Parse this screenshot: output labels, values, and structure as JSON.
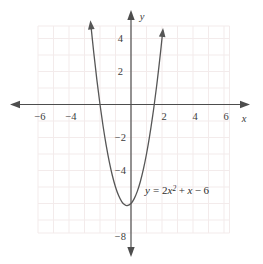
{
  "chart_data": {
    "type": "line",
    "title": "",
    "subtitle": "",
    "xlabel": "x",
    "ylabel": "y",
    "xlim": [
      -7,
      7
    ],
    "ylim": [
      -9,
      5
    ],
    "grid": true,
    "grid_color": "#f2eaea",
    "axis_color": "#4a4a4a",
    "curve_color": "#4a4a4a",
    "legend": "none",
    "annotation": "y = 2x² + x − 6",
    "equation": {
      "lhs": "y",
      "equals": "=",
      "coef": "2",
      "var1": "x",
      "exponent": "2",
      "plus": "+",
      "var2": "x",
      "minus": "−",
      "constant": "6"
    },
    "x_ticks": [
      {
        "value": -6,
        "label": "−6"
      },
      {
        "value": -4,
        "label": "−4"
      },
      {
        "value": -2,
        "label": ""
      },
      {
        "value": 2,
        "label": "2"
      },
      {
        "value": 4,
        "label": "4"
      },
      {
        "value": 6,
        "label": "6"
      }
    ],
    "y_ticks": [
      {
        "value": 4,
        "label": "4"
      },
      {
        "value": 2,
        "label": "2"
      },
      {
        "value": -2,
        "label": "−2"
      },
      {
        "value": -4,
        "label": "−4"
      },
      {
        "value": -6,
        "label": ""
      },
      {
        "value": -8,
        "label": "−8"
      }
    ],
    "series": [
      {
        "name": "y = 2x^2 + x - 6",
        "function": "2*x^2 + x - 6",
        "vertex": [
          -0.25,
          -6.125
        ],
        "roots": [
          -2,
          1.5
        ],
        "y_intercept": -6,
        "x_range": [
          -2.6,
          2.1
        ],
        "arrowheads": [
          "start",
          "end"
        ],
        "points": [
          {
            "x": -2.6,
            "y": 4.92
          },
          {
            "x": -2.4,
            "y": 3.12
          },
          {
            "x": -2.2,
            "y": 1.48
          },
          {
            "x": -2.0,
            "y": 0.0
          },
          {
            "x": -1.8,
            "y": -1.32
          },
          {
            "x": -1.6,
            "y": -2.48
          },
          {
            "x": -1.4,
            "y": -3.48
          },
          {
            "x": -1.2,
            "y": -4.32
          },
          {
            "x": -1.0,
            "y": -5.0
          },
          {
            "x": -0.8,
            "y": -5.52
          },
          {
            "x": -0.6,
            "y": -5.88
          },
          {
            "x": -0.4,
            "y": -6.08
          },
          {
            "x": -0.25,
            "y": -6.125
          },
          {
            "x": 0.0,
            "y": -6.0
          },
          {
            "x": 0.2,
            "y": -5.72
          },
          {
            "x": 0.4,
            "y": -5.28
          },
          {
            "x": 0.6,
            "y": -4.68
          },
          {
            "x": 0.8,
            "y": -3.92
          },
          {
            "x": 1.0,
            "y": -3.0
          },
          {
            "x": 1.2,
            "y": -1.92
          },
          {
            "x": 1.4,
            "y": -0.68
          },
          {
            "x": 1.5,
            "y": 0.0
          },
          {
            "x": 1.7,
            "y": 1.48
          },
          {
            "x": 1.9,
            "y": 3.12
          },
          {
            "x": 2.05,
            "y": 4.46
          }
        ]
      }
    ]
  }
}
